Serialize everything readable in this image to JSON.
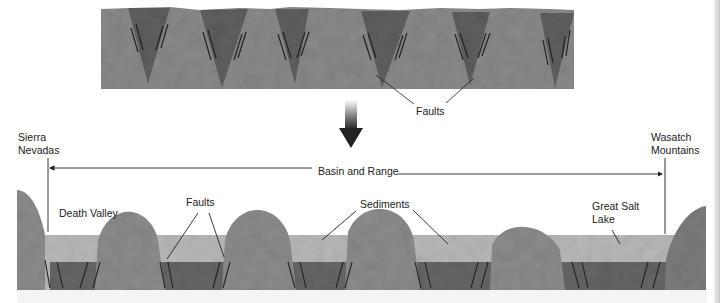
{
  "diagram": {
    "top_panel": {
      "faults_label": "Faults"
    },
    "arrow": {
      "direction": "down"
    },
    "bottom_panel": {
      "left_range_line1": "Sierra",
      "left_range_line2": "Nevadas",
      "right_range_line1": "Wasatch",
      "right_range_line2": "Mountains",
      "span_label": "Basin and Range",
      "death_valley": "Death Valley",
      "faults_label": "Faults",
      "sediments_label": "Sediments",
      "great_salt_line1": "Great Salt",
      "great_salt_line2": "Lake"
    },
    "colors": {
      "rock": "#8e8e8e",
      "rock_dark": "#6a6a6a",
      "graben": "#5e5e5e",
      "sediment": "#b8b8b8",
      "line": "#222222"
    }
  }
}
